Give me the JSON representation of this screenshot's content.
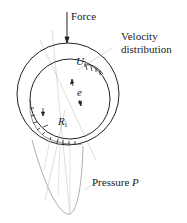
{
  "diagram": {
    "labels": {
      "force": "Force",
      "velocity_line1": "Velocity",
      "velocity_line2": "distribution",
      "ui_main": "U",
      "ui_sub": "i",
      "eccentricity": "e",
      "ri_main": "R",
      "ri_sub": "i",
      "pressure_text": "Pressure ",
      "pressure_symbol": "P"
    },
    "colors": {
      "line": "#222222",
      "guide": "#bbbbbb",
      "background": "#ffffff"
    }
  }
}
